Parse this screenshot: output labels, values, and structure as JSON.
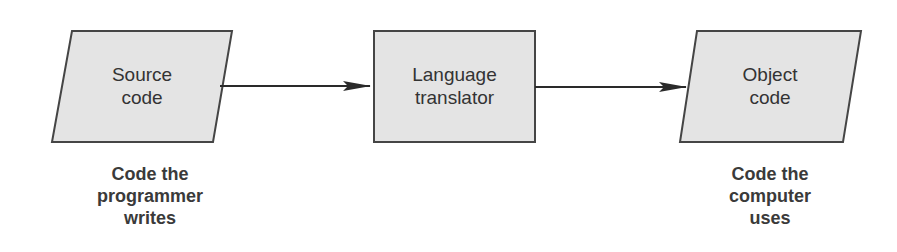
{
  "diagram": {
    "colors": {
      "shape_fill": "#e4e4e4",
      "shape_stroke": "#454545",
      "arrow": "#2a2a2a",
      "text": "#333333"
    },
    "nodes": [
      {
        "id": "source",
        "shape": "parallelogram",
        "label": "Source\ncode",
        "caption": "Code the\nprogrammer\nwrites"
      },
      {
        "id": "translator",
        "shape": "rectangle",
        "label": "Language\ntranslator"
      },
      {
        "id": "object",
        "shape": "parallelogram",
        "label": "Object\ncode",
        "caption": "Code the\ncomputer\nuses"
      }
    ],
    "edges": [
      {
        "from": "source",
        "to": "translator"
      },
      {
        "from": "translator",
        "to": "object"
      }
    ]
  }
}
